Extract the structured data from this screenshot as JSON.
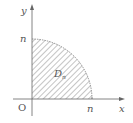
{
  "diagram": {
    "type": "quarter-disk-region",
    "labels": {
      "y_axis": "y",
      "x_axis": "x",
      "origin": "O",
      "y_intercept": "n",
      "x_intercept": "n",
      "region": "D",
      "region_subscript": "n"
    },
    "colors": {
      "axis": "#666666",
      "hatch": "#8a8a8a",
      "boundary": "#777777",
      "text": "#555555"
    }
  }
}
